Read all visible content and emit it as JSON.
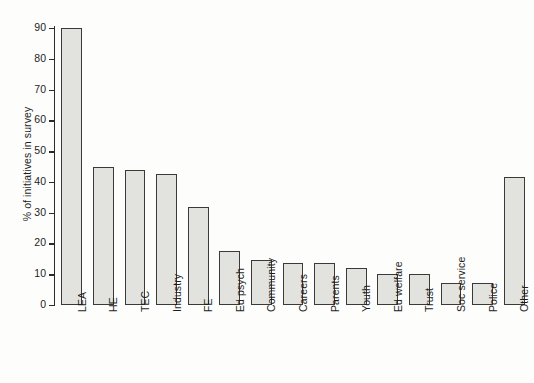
{
  "chart_data": {
    "type": "bar",
    "title": "",
    "subtitle": "",
    "xlabel": "",
    "ylabel": "% of initiatives in survey",
    "ylim": [
      0,
      90
    ],
    "yticks": [
      0,
      10,
      20,
      30,
      40,
      50,
      60,
      70,
      80,
      90
    ],
    "ytick_labels": [
      "0",
      "10",
      "20",
      "30",
      "40",
      "50",
      "60",
      "70",
      "80",
      "90"
    ],
    "grid": false,
    "legend": null,
    "orientation": "vertical",
    "bar_fill_color": "#e2e2df",
    "bar_edge_color": "#3a3a3a",
    "axis_color": "#2b2b2b",
    "background_color": "#fdfdfc",
    "categories": [
      "LEA",
      "HE",
      "TEC",
      "Industry",
      "FE",
      "Ed psych",
      "Community",
      "Careers",
      "Parents",
      "Youth",
      "Ed welfare",
      "Trust",
      "Soc service",
      "Police",
      "Other"
    ],
    "values": [
      90,
      45,
      44,
      42.5,
      32,
      17.5,
      14.5,
      13.5,
      13.5,
      12,
      10,
      10,
      7,
      7,
      41.5
    ]
  }
}
